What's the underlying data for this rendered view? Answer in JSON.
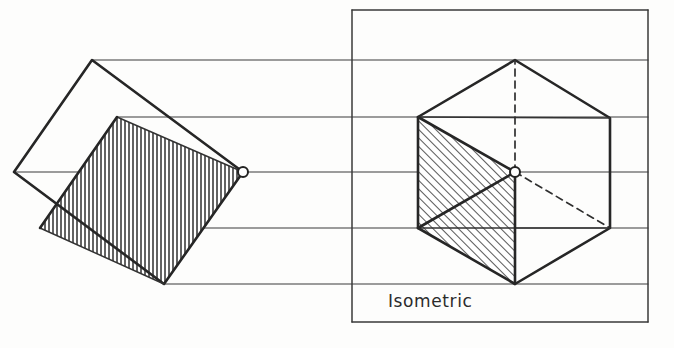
{
  "figure": {
    "background_color": "#fdfdfc",
    "ink_color": "#2b2b2b",
    "width": 674,
    "height": 348
  },
  "frame": {
    "name": "isometric-view-frame",
    "x": 352,
    "y": 10,
    "width": 296,
    "height": 312,
    "stroke": "#3a3a3a"
  },
  "labels": {
    "isometric": "Isometric"
  },
  "projection_lines": {
    "count": 5,
    "y_values": [
      60,
      117,
      172,
      228,
      284
    ],
    "x_start": 14,
    "x_end": 648,
    "stroke": "#3a3a3a"
  },
  "front_view": {
    "name": "front-view-tilted-square",
    "outline": [
      {
        "x": 14,
        "y": 172
      },
      {
        "x": 92,
        "y": 60
      },
      {
        "x": 243,
        "y": 172
      },
      {
        "x": 164,
        "y": 284
      }
    ],
    "hatched_face": [
      {
        "x": 117,
        "y": 117
      },
      {
        "x": 243,
        "y": 172
      },
      {
        "x": 164,
        "y": 284
      },
      {
        "x": 40,
        "y": 228
      }
    ],
    "hatch_direction": "vertical",
    "internal_lines": [
      {
        "x1": 40,
        "y1": 228,
        "x2": 164,
        "y2": 284
      },
      {
        "x1": 117,
        "y1": 117,
        "x2": 243,
        "y2": 172
      }
    ],
    "vertex_marker": {
      "x": 243,
      "y": 172,
      "radius": 5
    }
  },
  "isometric_view": {
    "name": "isometric-cube-hexagon",
    "outline": [
      {
        "x": 515,
        "y": 60
      },
      {
        "x": 610,
        "y": 118
      },
      {
        "x": 610,
        "y": 228
      },
      {
        "x": 515,
        "y": 284
      },
      {
        "x": 418,
        "y": 228
      },
      {
        "x": 418,
        "y": 117
      }
    ],
    "center": {
      "x": 515,
      "y": 172,
      "radius": 5
    },
    "hatched_face": [
      {
        "x": 418,
        "y": 117
      },
      {
        "x": 515,
        "y": 172
      },
      {
        "x": 515,
        "y": 284
      },
      {
        "x": 418,
        "y": 228
      }
    ],
    "hatch_direction": "diagonal",
    "visible_radials": [
      {
        "to_x": 418,
        "to_y": 117
      },
      {
        "to_x": 418,
        "to_y": 228
      },
      {
        "to_x": 515,
        "to_y": 284
      }
    ],
    "hidden_radials": [
      {
        "to_x": 515,
        "to_y": 60
      },
      {
        "to_x": 610,
        "to_y": 228
      }
    ],
    "inner_edges": [
      {
        "x1": 418,
        "y1": 117,
        "x2": 610,
        "y2": 118
      },
      {
        "x1": 418,
        "y1": 228,
        "x2": 610,
        "y2": 228
      }
    ]
  }
}
